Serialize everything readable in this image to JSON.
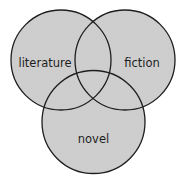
{
  "diagram": {
    "type": "venn",
    "background": "#ffffff",
    "fill_color": "#cfcfcf",
    "stroke_color": "#1e1e1e",
    "circles": [
      {
        "label": "literature",
        "cx": 61,
        "cy": 60,
        "r": 50
      },
      {
        "label": "fiction",
        "cx": 125,
        "cy": 60,
        "r": 50
      },
      {
        "label": "novel",
        "cx": 93.5,
        "cy": 122,
        "r": 51.5
      }
    ],
    "labels": {
      "literature": {
        "text": "literature",
        "x": 45,
        "y": 63
      },
      "fiction": {
        "text": "fiction",
        "x": 142,
        "y": 63
      },
      "novel": {
        "text": "novel",
        "x": 93.5,
        "y": 139
      }
    }
  }
}
